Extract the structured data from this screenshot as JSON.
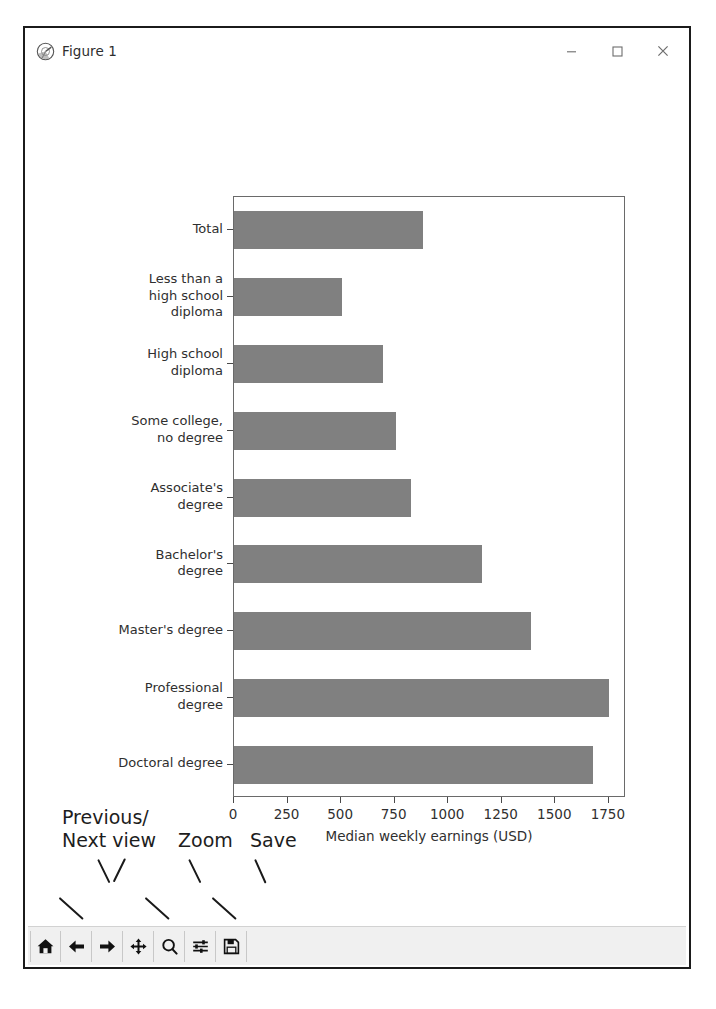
{
  "window": {
    "title": "Figure 1",
    "icon": "matplotlib-icon",
    "controls": {
      "minimize": "minimize-icon",
      "maximize": "maximize-icon",
      "close": "close-icon"
    }
  },
  "chart_data": {
    "type": "bar",
    "orientation": "horizontal",
    "title": "",
    "xlabel": "Median weekly earnings (USD)",
    "ylabel": "",
    "xlim": [
      0,
      1830
    ],
    "xticks": [
      0,
      250,
      500,
      750,
      1000,
      1250,
      1500,
      1750
    ],
    "xticklabels": [
      "0",
      "250",
      "500",
      "750",
      "1000",
      "1250",
      "1500",
      "1750"
    ],
    "grid": false,
    "legend": false,
    "bar_color": "#808080",
    "categories": [
      "Total",
      "Less than a\nhigh school\ndiploma",
      "High school\ndiploma",
      "Some college,\nno degree",
      "Associate's\ndegree",
      "Bachelor's\ndegree",
      "Master's degree",
      "Professional\ndegree",
      "Doctoral degree"
    ],
    "values": [
      883,
      505,
      696,
      756,
      827,
      1159,
      1387,
      1752,
      1677
    ]
  },
  "toolbar": {
    "buttons": [
      {
        "name": "home-button",
        "icon": "home-icon",
        "tooltip": "Reset original view"
      },
      {
        "name": "back-button",
        "icon": "arrow-left-icon",
        "tooltip": "Back to previous view"
      },
      {
        "name": "forward-button",
        "icon": "arrow-right-icon",
        "tooltip": "Forward to next view"
      },
      {
        "name": "pan-button",
        "icon": "move-cross-icon",
        "tooltip": "Pan axes with left mouse, zoom with right"
      },
      {
        "name": "zoom-button",
        "icon": "magnifier-icon",
        "tooltip": "Zoom to rectangle"
      },
      {
        "name": "subplots-button",
        "icon": "sliders-icon",
        "tooltip": "Configure subplots"
      },
      {
        "name": "save-button",
        "icon": "floppy-disk-icon",
        "tooltip": "Save the figure"
      }
    ]
  },
  "annotations": {
    "previous_next": "Previous/\nNext view",
    "zoom": "Zoom",
    "save": "Save",
    "reset_view": "Reset view",
    "pan": "Pan",
    "configure": "Configure subplot margins"
  }
}
